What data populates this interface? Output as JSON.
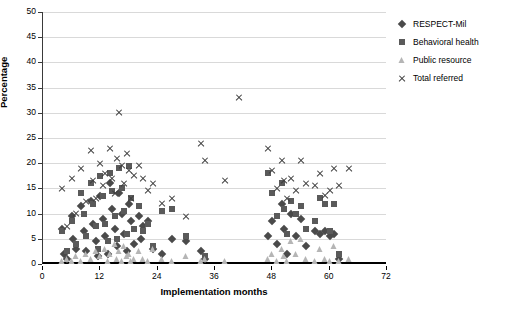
{
  "chart_data": {
    "type": "scatter",
    "title": "",
    "xlabel": "Implementation months",
    "ylabel": "Percentage",
    "xlim": [
      0,
      72
    ],
    "ylim": [
      0,
      50
    ],
    "xticks": [
      0,
      12,
      24,
      36,
      48,
      60,
      72
    ],
    "yticks": [
      0,
      5,
      10,
      15,
      20,
      25,
      30,
      35,
      40,
      45,
      50
    ],
    "grid": "horizontal",
    "legend_position": "right",
    "series": [
      {
        "name": "RESPECT-Mil",
        "marker": "diamond",
        "color": "#4a4a4a",
        "points": [
          [
            4.0,
            7.0
          ],
          [
            4.3,
            2.0
          ],
          [
            5.0,
            1.0
          ],
          [
            6.0,
            9.5
          ],
          [
            6.3,
            5.0
          ],
          [
            7.0,
            3.0
          ],
          [
            8.0,
            11.5
          ],
          [
            8.5,
            6.5
          ],
          [
            9.0,
            2.5
          ],
          [
            10.0,
            12.5
          ],
          [
            10.5,
            8.0
          ],
          [
            11.0,
            4.5
          ],
          [
            11.5,
            1.5
          ],
          [
            12.0,
            13.5
          ],
          [
            12.5,
            9.0
          ],
          [
            13.0,
            5.5
          ],
          [
            13.5,
            2.0
          ],
          [
            14.0,
            16.0
          ],
          [
            14.5,
            11.0
          ],
          [
            15.0,
            7.0
          ],
          [
            15.5,
            3.5
          ],
          [
            16.0,
            14.0
          ],
          [
            16.5,
            10.0
          ],
          [
            17.0,
            6.0
          ],
          [
            17.5,
            2.5
          ],
          [
            18.0,
            12.0
          ],
          [
            18.5,
            8.5
          ],
          [
            19.0,
            4.0
          ],
          [
            20.0,
            9.5
          ],
          [
            20.5,
            5.0
          ],
          [
            21.0,
            7.5
          ],
          [
            22.0,
            8.5
          ],
          [
            23.0,
            3.0
          ],
          [
            25.0,
            2.0
          ],
          [
            27.0,
            5.0
          ],
          [
            30.0,
            4.5
          ],
          [
            33.0,
            2.5
          ],
          [
            34.0,
            1.0
          ],
          [
            47.0,
            5.5
          ],
          [
            48.0,
            8.5
          ],
          [
            49.0,
            4.0
          ],
          [
            50.0,
            12.0
          ],
          [
            50.5,
            7.0
          ],
          [
            51.0,
            2.0
          ],
          [
            52.0,
            10.0
          ],
          [
            53.0,
            5.5
          ],
          [
            54.0,
            9.0
          ],
          [
            55.0,
            3.5
          ],
          [
            57.0,
            6.5
          ],
          [
            58.0,
            6.0
          ],
          [
            59.0,
            6.5
          ],
          [
            60.0,
            5.5
          ],
          [
            61.0,
            6.0
          ],
          [
            62.0,
            1.0
          ]
        ]
      },
      {
        "name": "Behavioral health",
        "marker": "square",
        "color": "#5a5a5a",
        "points": [
          [
            4.0,
            6.5
          ],
          [
            5.0,
            2.5
          ],
          [
            6.0,
            8.5
          ],
          [
            7.0,
            4.0
          ],
          [
            8.0,
            14.0
          ],
          [
            8.5,
            10.0
          ],
          [
            9.0,
            5.5
          ],
          [
            10.0,
            16.0
          ],
          [
            10.5,
            12.0
          ],
          [
            11.0,
            7.5
          ],
          [
            11.5,
            3.0
          ],
          [
            12.0,
            17.5
          ],
          [
            12.5,
            13.5
          ],
          [
            13.0,
            8.0
          ],
          [
            13.5,
            4.5
          ],
          [
            14.0,
            18.0
          ],
          [
            14.5,
            14.5
          ],
          [
            15.0,
            9.5
          ],
          [
            15.5,
            5.0
          ],
          [
            16.0,
            19.0
          ],
          [
            16.5,
            15.0
          ],
          [
            17.0,
            10.5
          ],
          [
            17.5,
            6.0
          ],
          [
            18.0,
            19.5
          ],
          [
            18.5,
            13.0
          ],
          [
            19.0,
            7.0
          ],
          [
            20.0,
            11.5
          ],
          [
            21.0,
            6.5
          ],
          [
            22.0,
            8.0
          ],
          [
            23.0,
            3.5
          ],
          [
            25.0,
            10.5
          ],
          [
            27.0,
            11.0
          ],
          [
            30.0,
            5.5
          ],
          [
            34.0,
            1.5
          ],
          [
            47.0,
            18.0
          ],
          [
            48.0,
            14.0
          ],
          [
            49.0,
            9.5
          ],
          [
            50.0,
            16.0
          ],
          [
            50.5,
            11.0
          ],
          [
            51.0,
            6.0
          ],
          [
            52.0,
            12.5
          ],
          [
            53.0,
            10.0
          ],
          [
            54.0,
            11.5
          ],
          [
            55.0,
            7.0
          ],
          [
            57.0,
            8.5
          ],
          [
            58.0,
            13.0
          ],
          [
            59.0,
            12.0
          ],
          [
            60.0,
            6.5
          ],
          [
            61.0,
            12.0
          ],
          [
            62.0,
            2.0
          ]
        ]
      },
      {
        "name": "Public resource",
        "marker": "triangle",
        "color": "#b5b5b5",
        "points": [
          [
            4.0,
            0.5
          ],
          [
            5.0,
            1.0
          ],
          [
            6.0,
            0.5
          ],
          [
            7.0,
            1.5
          ],
          [
            8.0,
            0.5
          ],
          [
            9.0,
            2.0
          ],
          [
            10.0,
            1.0
          ],
          [
            11.0,
            2.5
          ],
          [
            12.0,
            1.5
          ],
          [
            13.0,
            3.0
          ],
          [
            13.5,
            0.5
          ],
          [
            14.0,
            2.0
          ],
          [
            15.0,
            4.0
          ],
          [
            15.5,
            1.0
          ],
          [
            16.0,
            2.5
          ],
          [
            16.5,
            0.5
          ],
          [
            17.0,
            3.5
          ],
          [
            17.5,
            1.5
          ],
          [
            18.0,
            2.0
          ],
          [
            18.5,
            0.5
          ],
          [
            19.0,
            1.0
          ],
          [
            20.0,
            2.5
          ],
          [
            21.0,
            1.0
          ],
          [
            22.0,
            0.5
          ],
          [
            23.0,
            3.0
          ],
          [
            25.0,
            1.0
          ],
          [
            27.0,
            0.5
          ],
          [
            30.0,
            1.5
          ],
          [
            33.0,
            0.5
          ],
          [
            34.0,
            1.0
          ],
          [
            38.0,
            0.5
          ],
          [
            47.0,
            1.0
          ],
          [
            48.0,
            2.0
          ],
          [
            49.0,
            0.5
          ],
          [
            50.0,
            3.0
          ],
          [
            50.5,
            1.5
          ],
          [
            51.0,
            0.5
          ],
          [
            52.0,
            4.5
          ],
          [
            53.0,
            2.0
          ],
          [
            54.0,
            5.0
          ],
          [
            55.0,
            1.0
          ],
          [
            57.0,
            0.5
          ],
          [
            58.0,
            3.0
          ],
          [
            59.0,
            1.0
          ],
          [
            60.0,
            0.5
          ],
          [
            61.0,
            3.5
          ],
          [
            62.0,
            0.5
          ],
          [
            64.0,
            1.0
          ]
        ]
      },
      {
        "name": "Total referred",
        "marker": "cross",
        "color": "#3d3d3d",
        "points": [
          [
            4.0,
            15.0
          ],
          [
            5.0,
            7.5
          ],
          [
            6.0,
            17.0
          ],
          [
            7.0,
            10.0
          ],
          [
            8.0,
            19.0
          ],
          [
            9.0,
            12.5
          ],
          [
            10.0,
            22.5
          ],
          [
            10.5,
            16.5
          ],
          [
            11.0,
            13.0
          ],
          [
            12.0,
            20.0
          ],
          [
            12.5,
            15.5
          ],
          [
            13.0,
            18.0
          ],
          [
            14.0,
            23.0
          ],
          [
            14.5,
            17.0
          ],
          [
            15.0,
            14.0
          ],
          [
            15.5,
            21.0
          ],
          [
            16.0,
            30.0
          ],
          [
            16.5,
            19.5
          ],
          [
            17.0,
            16.0
          ],
          [
            17.5,
            22.0
          ],
          [
            18.0,
            18.5
          ],
          [
            18.5,
            13.0
          ],
          [
            19.0,
            17.5
          ],
          [
            20.0,
            19.5
          ],
          [
            21.0,
            17.0
          ],
          [
            22.0,
            14.5
          ],
          [
            23.0,
            16.0
          ],
          [
            25.0,
            12.0
          ],
          [
            27.0,
            13.0
          ],
          [
            30.0,
            9.5
          ],
          [
            33.0,
            24.0
          ],
          [
            34.0,
            20.5
          ],
          [
            38.0,
            16.5
          ],
          [
            41.0,
            33.0
          ],
          [
            47.0,
            23.0
          ],
          [
            48.0,
            18.5
          ],
          [
            49.0,
            15.0
          ],
          [
            50.0,
            20.5
          ],
          [
            50.5,
            16.5
          ],
          [
            51.0,
            13.0
          ],
          [
            52.0,
            17.0
          ],
          [
            53.0,
            14.5
          ],
          [
            54.0,
            20.5
          ],
          [
            55.0,
            16.0
          ],
          [
            57.0,
            15.5
          ],
          [
            58.0,
            18.0
          ],
          [
            59.0,
            13.5
          ],
          [
            60.0,
            14.5
          ],
          [
            61.0,
            19.0
          ],
          [
            62.0,
            15.5
          ],
          [
            64.0,
            19.0
          ]
        ]
      }
    ]
  },
  "legend": {
    "items": [
      {
        "label": "RESPECT-Mil",
        "marker": "diamond"
      },
      {
        "label": "Behavioral health",
        "marker": "square"
      },
      {
        "label": "Public resource",
        "marker": "triangle"
      },
      {
        "label": "Total referred",
        "marker": "cross"
      }
    ]
  }
}
